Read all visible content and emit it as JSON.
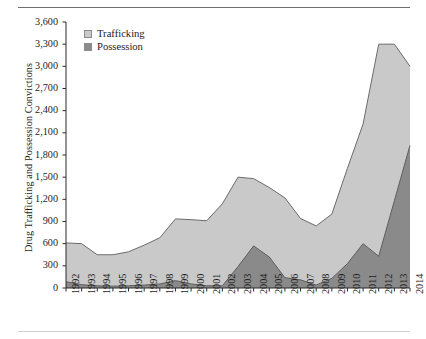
{
  "figure": {
    "ylabel": "Drug Trafficking and Possession Convictions",
    "legend": {
      "trafficking_label": "Trafficking",
      "possession_label": "Possession",
      "trafficking_color": "#c9c9c9",
      "possession_color": "#8a8a8a"
    }
  },
  "chart_data": {
    "type": "area",
    "stacked": true,
    "title": "",
    "xlabel": "",
    "ylabel": "Drug Trafficking and Possession Convictions",
    "categories": [
      "1992",
      "1993",
      "1994",
      "1995",
      "1996",
      "1997",
      "1998",
      "1999",
      "2000",
      "2001",
      "2002",
      "2003",
      "2004",
      "2005",
      "2006",
      "2007",
      "2008",
      "2009",
      "2010",
      "2011",
      "2012",
      "2013",
      "2014"
    ],
    "x": [
      1992,
      1993,
      1994,
      1995,
      1996,
      1997,
      1998,
      1999,
      2000,
      2001,
      2002,
      2003,
      2004,
      2005,
      2006,
      2007,
      2008,
      2009,
      2010,
      2011,
      2012,
      2013,
      2014
    ],
    "series": [
      {
        "name": "Possession",
        "color": "#8a8a8a",
        "values": [
          85,
          45,
          30,
          25,
          30,
          40,
          55,
          100,
          55,
          30,
          30,
          290,
          570,
          420,
          140,
          110,
          40,
          130,
          330,
          600,
          430,
          1180,
          1930
        ]
      },
      {
        "name": "Trafficking",
        "color": "#c9c9c9",
        "values": [
          525,
          555,
          420,
          425,
          460,
          540,
          625,
          835,
          870,
          880,
          1110,
          1210,
          910,
          940,
          1080,
          830,
          800,
          870,
          1290,
          1620,
          2870,
          2120,
          1070
        ]
      }
    ],
    "totals": [
      610,
      600,
      450,
      450,
      490,
      580,
      680,
      935,
      925,
      910,
      1140,
      1500,
      1480,
      1360,
      1220,
      940,
      840,
      1000,
      1620,
      2220,
      3300,
      3300,
      3000
    ],
    "ylim": [
      0,
      3600
    ],
    "ytick_labels": [
      "3,600",
      "3,300",
      "3,000",
      "2,700",
      "2,400",
      "2,100",
      "1,800",
      "1,500",
      "1,200",
      "900",
      "600",
      "300",
      "0"
    ],
    "ytick_values": [
      3600,
      3300,
      3000,
      2700,
      2400,
      2100,
      1800,
      1500,
      1200,
      900,
      600,
      300,
      0
    ],
    "grid": false,
    "legend_position": "upper-left-inside"
  }
}
